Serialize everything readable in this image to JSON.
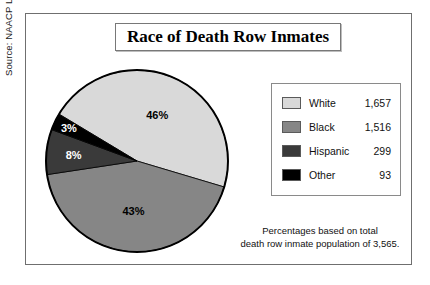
{
  "figure": {
    "title": "Race of Death Row Inmates",
    "source": "Source: NAACP Legal Defense Fund, 1999.",
    "footnote_line1": "Percentages based on total",
    "footnote_line2": "death row inmate population of 3,565."
  },
  "legend": {
    "rows": [
      {
        "label": "White",
        "value": "1,657",
        "color": "#d9d9d9"
      },
      {
        "label": "Black",
        "value": "1,516",
        "color": "#868686"
      },
      {
        "label": "Hispanic",
        "value": "299",
        "color": "#3a3a3a"
      },
      {
        "label": "Other",
        "value": "93",
        "color": "#000000"
      }
    ]
  },
  "chart_data": {
    "type": "pie",
    "title": "Race of Death Row Inmates",
    "categories": [
      "White",
      "Black",
      "Hispanic",
      "Other"
    ],
    "values": [
      1657,
      1516,
      299,
      93
    ],
    "total": 3565,
    "percent_labels": [
      "46%",
      "43%",
      "8%",
      "3%"
    ],
    "percentages": [
      46,
      43,
      8,
      3
    ],
    "colors": [
      "#d9d9d9",
      "#868686",
      "#3a3a3a",
      "#000000"
    ],
    "legend_position": "right",
    "grid": false,
    "xlabel": "",
    "ylabel": "",
    "notes": "Percentages based on total death row inmate population of 3,565.",
    "source": "Source: NAACP Legal Defense Fund, 1999."
  }
}
